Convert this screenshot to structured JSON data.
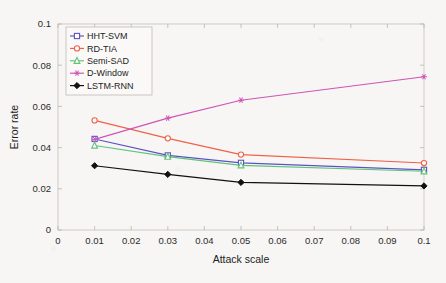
{
  "chart_data": {
    "type": "line",
    "title": "",
    "xlabel": "Attack scale",
    "ylabel": "Error rate",
    "xlim": [
      0,
      0.1
    ],
    "ylim": [
      0,
      0.1
    ],
    "grid": false,
    "legend_position": "top-left",
    "x": [
      0.01,
      0.03,
      0.05,
      0.1
    ],
    "xticks": [
      "0",
      "0.01",
      "0.02",
      "0.03",
      "0.04",
      "0.05",
      "0.06",
      "0.07",
      "0.08",
      "0.09",
      "0.1"
    ],
    "xtick_values": [
      0,
      0.01,
      0.02,
      0.03,
      0.04,
      0.05,
      0.06,
      0.07,
      0.08,
      0.09,
      0.1
    ],
    "yticks": [
      "0",
      "0.02",
      "0.04",
      "0.06",
      "0.08",
      "0.1"
    ],
    "ytick_values": [
      0,
      0.02,
      0.04,
      0.06,
      0.08,
      0.1
    ],
    "series": [
      {
        "name": "HHT-SVM",
        "color": "#5b52c4",
        "marker": "square",
        "values": [
          0.0442,
          0.0362,
          0.0326,
          0.0292
        ]
      },
      {
        "name": "RD-TIA",
        "color": "#f0604a",
        "marker": "circle",
        "values": [
          0.0532,
          0.0445,
          0.0366,
          0.0325
        ]
      },
      {
        "name": "Semi-SAD",
        "color": "#63c27a",
        "marker": "triangle",
        "values": [
          0.041,
          0.0356,
          0.0314,
          0.0285
        ]
      },
      {
        "name": "D-Window",
        "color": "#cf54b6",
        "marker": "star",
        "values": [
          0.044,
          0.0543,
          0.063,
          0.0744
        ]
      },
      {
        "name": "LSTM-RNN",
        "color": "#111111",
        "marker": "diamond",
        "values": [
          0.0312,
          0.027,
          0.0231,
          0.0214
        ]
      }
    ]
  },
  "legend": {
    "items": [
      {
        "label": "HHT-SVM"
      },
      {
        "label": "RD-TIA"
      },
      {
        "label": "Semi-SAD"
      },
      {
        "label": "D-Window"
      },
      {
        "label": "LSTM-RNN"
      }
    ]
  }
}
